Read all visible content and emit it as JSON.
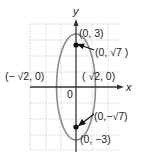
{
  "diagram": {
    "type": "ellipse-graph",
    "equation_implied": "x^2/2 + y^2/9 = 1",
    "axes": {
      "x_label": "x",
      "y_label": "y",
      "origin_label": "0"
    },
    "points": {
      "top_vertex": "(0, 3)",
      "top_focus": "(0, √7 )",
      "left_covertex": "(− √2, 0)",
      "right_covertex": "( √2, 0)",
      "bottom_focus": "(0,−√7)",
      "bottom_vertex": "(0,  −3)"
    },
    "colors": {
      "ellipse": "#8a8a8a",
      "axis": "#333333",
      "grid": "#d6d6d6",
      "point": "#111111"
    }
  }
}
